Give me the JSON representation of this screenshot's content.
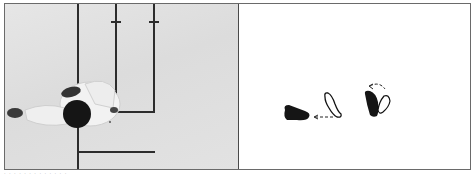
{
  "figure": {
    "left_panel": {
      "description": "Overhead photograph of a person in white uniform crouching on a floor with taped lines",
      "line_color": "#2c2c2c",
      "floor_color": "#e0e0e0"
    },
    "right_panel": {
      "description": "Footwork diagram",
      "footprints": [
        {
          "name": "left-foot-solid",
          "style": "filled"
        },
        {
          "name": "foot-outline-center",
          "style": "outline"
        },
        {
          "name": "right-foot-solid",
          "style": "filled"
        },
        {
          "name": "foot-outline-pivot",
          "style": "outline"
        }
      ],
      "arrows": [
        {
          "name": "dashed-arrow-left",
          "direction": "left"
        },
        {
          "name": "dashed-arrow-curved",
          "direction": "counter-clockwise"
        }
      ]
    }
  },
  "caption": {
    "text": "· · ·  · ·  · · ·  · ·  · · ·"
  }
}
